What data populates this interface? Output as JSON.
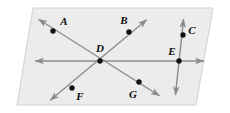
{
  "figure": {
    "type": "geometry-diagram",
    "background_color": "#ffffff",
    "plane": {
      "name": "plane-parallelogram",
      "fill_color": "#ececec",
      "stroke_color": "#d2d2d2",
      "corners": [
        {
          "x": 33,
          "y": 8
        },
        {
          "x": 213,
          "y": 8
        },
        {
          "x": 196,
          "y": 105
        },
        {
          "x": 17,
          "y": 105
        }
      ]
    },
    "line_color": "#8c8c8c",
    "line_width": 1.4,
    "point_color": "#111111",
    "point_radius": 2.7,
    "lines": [
      {
        "name": "horizontal-line",
        "label": "horizontal line through D and E",
        "x1": 31,
        "y1": 61,
        "x2": 208,
        "y2": 61,
        "arrow_start": true,
        "arrow_end": true
      },
      {
        "name": "diagonal-line-ag",
        "label": "diagonal line through A, D and G",
        "x1": 35,
        "y1": 17,
        "x2": 163,
        "y2": 98,
        "arrow_start": true,
        "arrow_end": true
      },
      {
        "name": "diagonal-line-bf",
        "label": "diagonal line through B, D and F",
        "x1": 150,
        "y1": 17,
        "x2": 47,
        "y2": 103,
        "arrow_start": true,
        "arrow_end": true
      },
      {
        "name": "vertical-line-ce",
        "label": "near-vertical line through C and E",
        "x1": 184,
        "y1": 15,
        "x2": 175,
        "y2": 99,
        "arrow_start": true,
        "arrow_end": true
      }
    ],
    "points": [
      {
        "name": "point-a",
        "label": "A",
        "x": 53,
        "y": 31,
        "label_x": 64,
        "label_y": 21
      },
      {
        "name": "point-b",
        "label": "B",
        "x": 129,
        "y": 32,
        "label_x": 124,
        "label_y": 20
      },
      {
        "name": "point-c",
        "label": "C",
        "x": 183,
        "y": 35,
        "label_x": 192,
        "label_y": 30
      },
      {
        "name": "point-d",
        "label": "D",
        "x": 100,
        "y": 61,
        "label_x": 100,
        "label_y": 48
      },
      {
        "name": "point-e",
        "label": "E",
        "x": 179,
        "y": 61,
        "label_x": 172,
        "label_y": 51
      },
      {
        "name": "point-f",
        "label": "F",
        "x": 72,
        "y": 88,
        "label_x": 80,
        "label_y": 96
      },
      {
        "name": "point-g",
        "label": "G",
        "x": 139,
        "y": 82,
        "label_x": 133,
        "label_y": 94
      }
    ]
  }
}
